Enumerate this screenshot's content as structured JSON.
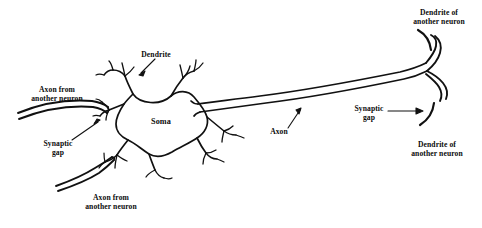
{
  "figure": {
    "background_color": "#ffffff",
    "ink_color": "#111111"
  },
  "labels": {
    "dendrite": "Dendrite",
    "soma": "Soma",
    "axon": "Axon",
    "axon_from_another_neuron_upper": "Axon from\nanother neuron",
    "axon_from_another_neuron_lower": "Axon from\nanother neuron",
    "synaptic_gap_left": "Synaptic\ngap",
    "synaptic_gap_right": "Synaptic\ngap",
    "dendrite_of_another_neuron_upper": "Dendrite of\nanother neuron",
    "dendrite_of_another_neuron_lower": "Dendrite of\nanother neuron"
  },
  "parts": {
    "soma_name": "cell-body-soma",
    "axon_name": "axon-tube",
    "dendrite_name": "dendrite-branch",
    "terminal_name": "axon-terminal",
    "incoming_axon_name": "incoming-axon",
    "target_dendrite_name": "target-dendrite-arc"
  }
}
